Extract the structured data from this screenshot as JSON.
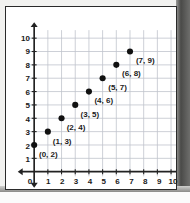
{
  "chart_data": {
    "type": "scatter",
    "title": "",
    "xlabel": "",
    "ylabel": "",
    "xlim": [
      0,
      10
    ],
    "ylim": [
      0,
      10
    ],
    "grid": true,
    "legend": "none",
    "x_ticks": [
      "0",
      "1",
      "2",
      "3",
      "4",
      "5",
      "6",
      "7",
      "8",
      "9",
      "10"
    ],
    "y_ticks": [
      "1",
      "2",
      "3",
      "4",
      "5",
      "6",
      "7",
      "8",
      "9",
      "10"
    ],
    "points": [
      {
        "x": 0,
        "y": 2,
        "label": "(0, 2)"
      },
      {
        "x": 1,
        "y": 3,
        "label": "(1, 3)"
      },
      {
        "x": 2,
        "y": 4,
        "label": "(2, 4)"
      },
      {
        "x": 3,
        "y": 5,
        "label": "(3, 5)"
      },
      {
        "x": 4,
        "y": 6,
        "label": "(4, 6)"
      },
      {
        "x": 5,
        "y": 7,
        "label": "(5, 7)"
      },
      {
        "x": 6,
        "y": 8,
        "label": "(6, 8)"
      },
      {
        "x": 7,
        "y": 9,
        "label": "(7, 9)"
      }
    ],
    "colors": {
      "point": "#111111",
      "axis": "#222222",
      "grid": "#bfc4cc",
      "background": "#ffffff",
      "text": "#1a1a1a"
    }
  },
  "axes": {
    "x_arrow_left": "arrow-left",
    "x_arrow_right": "arrow-right",
    "y_arrow_up": "arrow-up",
    "y_arrow_down": "arrow-down",
    "origin_label": "0"
  }
}
